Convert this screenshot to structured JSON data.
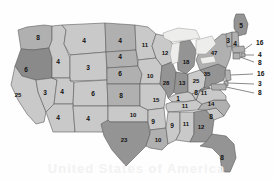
{
  "watermark_text": "United States of America",
  "palette": {
    "light": "#c9c9c9",
    "medium": "#b0b0b0",
    "dark": "#949494",
    "darker": "#8a8a8a",
    "lake": "#ededec",
    "border": "#5d5d5d",
    "label": "#111111",
    "background": "#ffffff"
  },
  "chart_data": {
    "type": "map",
    "ylabel": "",
    "xlabel": "",
    "value_range": [
      1,
      47
    ],
    "legend": "none",
    "categories": [
      "WA",
      "OR",
      "CA",
      "NV",
      "ID",
      "MT",
      "WY",
      "UT",
      "CO",
      "AZ",
      "NM",
      "ND",
      "SD",
      "NE",
      "KS",
      "OK",
      "TX",
      "MN",
      "IA",
      "MO",
      "AR",
      "LA",
      "WI",
      "IL",
      "MI",
      "IN",
      "OH",
      "KY",
      "TN",
      "MS",
      "AL",
      "GA",
      "FL",
      "SC",
      "NC",
      "VA",
      "WV",
      "PA",
      "NY",
      "ME",
      "VT",
      "NH",
      "MA",
      "RI",
      "CT",
      "NJ",
      "DE",
      "MD"
    ],
    "values": [
      8,
      6,
      25,
      3,
      4,
      4,
      3,
      4,
      6,
      4,
      4,
      4,
      4,
      6,
      8,
      10,
      23,
      11,
      10,
      15,
      9,
      10,
      12,
      28,
      18,
      13,
      25,
      1,
      11,
      9,
      11,
      12,
      8,
      8,
      14,
      11,
      8,
      35,
      47,
      5,
      3,
      4,
      16,
      4,
      8,
      16,
      3,
      8
    ],
    "series": [
      {
        "name": "value",
        "points": [
          {
            "state": "WA",
            "label": "Washington",
            "value": 8,
            "shade": "medium"
          },
          {
            "state": "OR",
            "label": "Oregon",
            "value": 6,
            "shade": "darker"
          },
          {
            "state": "CA",
            "label": "California",
            "value": 25,
            "shade": "light"
          },
          {
            "state": "NV",
            "label": "Nevada",
            "value": 3,
            "shade": "light"
          },
          {
            "state": "ID",
            "label": "Idaho",
            "value": 4,
            "shade": "light"
          },
          {
            "state": "MT",
            "label": "Montana",
            "value": 4,
            "shade": "light"
          },
          {
            "state": "WY",
            "label": "Wyoming",
            "value": 3,
            "shade": "light"
          },
          {
            "state": "UT",
            "label": "Utah",
            "value": 4,
            "shade": "light"
          },
          {
            "state": "CO",
            "label": "Colorado",
            "value": 6,
            "shade": "light"
          },
          {
            "state": "AZ",
            "label": "Arizona",
            "value": 4,
            "shade": "light"
          },
          {
            "state": "NM",
            "label": "New Mexico",
            "value": 4,
            "shade": "light"
          },
          {
            "state": "ND",
            "label": "North Dakota",
            "value": 4,
            "shade": "medium"
          },
          {
            "state": "SD",
            "label": "South Dakota",
            "value": 4,
            "shade": "medium"
          },
          {
            "state": "NE",
            "label": "Nebraska",
            "value": 6,
            "shade": "medium"
          },
          {
            "state": "KS",
            "label": "Kansas",
            "value": 8,
            "shade": "medium"
          },
          {
            "state": "OK",
            "label": "Oklahoma",
            "value": 10,
            "shade": "light"
          },
          {
            "state": "TX",
            "label": "Texas",
            "value": 23,
            "shade": "dark"
          },
          {
            "state": "MN",
            "label": "Minnesota",
            "value": 11,
            "shade": "light"
          },
          {
            "state": "IA",
            "label": "Iowa",
            "value": 10,
            "shade": "light"
          },
          {
            "state": "MO",
            "label": "Missouri",
            "value": 15,
            "shade": "light"
          },
          {
            "state": "AR",
            "label": "Arkansas",
            "value": 9,
            "shade": "light"
          },
          {
            "state": "LA",
            "label": "Louisiana",
            "value": 10,
            "shade": "medium"
          },
          {
            "state": "WI",
            "label": "Wisconsin",
            "value": 12,
            "shade": "light"
          },
          {
            "state": "IL",
            "label": "Illinois",
            "value": 28,
            "shade": "dark"
          },
          {
            "state": "MI",
            "label": "Michigan",
            "value": 18,
            "shade": "dark"
          },
          {
            "state": "IN",
            "label": "Indiana",
            "value": 13,
            "shade": "dark"
          },
          {
            "state": "OH",
            "label": "Ohio",
            "value": 25,
            "shade": "light"
          },
          {
            "state": "KY",
            "label": "Kentucky",
            "value": 1,
            "shade": "light"
          },
          {
            "state": "TN",
            "label": "Tennessee",
            "value": 11,
            "shade": "light"
          },
          {
            "state": "MS",
            "label": "Mississippi",
            "value": 9,
            "shade": "light"
          },
          {
            "state": "AL",
            "label": "Alabama",
            "value": 11,
            "shade": "light"
          },
          {
            "state": "GA",
            "label": "Georgia",
            "value": 12,
            "shade": "dark"
          },
          {
            "state": "FL",
            "label": "Florida",
            "value": 8,
            "shade": "dark"
          },
          {
            "state": "SC",
            "label": "South Carolina",
            "value": 8,
            "shade": "light"
          },
          {
            "state": "NC",
            "label": "North Carolina",
            "value": 14,
            "shade": "medium"
          },
          {
            "state": "VA",
            "label": "Virginia",
            "value": 11,
            "shade": "light"
          },
          {
            "state": "WV",
            "label": "West Virginia",
            "value": 8,
            "shade": "light"
          },
          {
            "state": "PA",
            "label": "Pennsylvania",
            "value": 35,
            "shade": "dark"
          },
          {
            "state": "NY",
            "label": "New York",
            "value": 47,
            "shade": "medium"
          },
          {
            "state": "ME",
            "label": "Maine",
            "value": 5,
            "shade": "dark"
          },
          {
            "state": "VT",
            "label": "Vermont",
            "value": 3,
            "shade": "medium"
          },
          {
            "state": "NH",
            "label": "New Hampshire",
            "value": 4,
            "shade": "medium"
          },
          {
            "state": "MA",
            "label": "Massachusetts",
            "value": 16,
            "shade": "medium"
          },
          {
            "state": "RI",
            "label": "Rhode Island",
            "value": 4,
            "shade": "medium"
          },
          {
            "state": "CT",
            "label": "Connecticut",
            "value": 8,
            "shade": "medium"
          },
          {
            "state": "NJ",
            "label": "New Jersey",
            "value": 16,
            "shade": "medium"
          },
          {
            "state": "DE",
            "label": "Delaware",
            "value": 3,
            "shade": "medium"
          },
          {
            "state": "MD",
            "label": "Maryland",
            "value": 8,
            "shade": "medium"
          }
        ]
      }
    ],
    "inline_labels": [
      {
        "id": "wa",
        "text": "8",
        "x": 38,
        "y": 38
      },
      {
        "id": "or",
        "text": "6",
        "x": 26,
        "y": 70
      },
      {
        "id": "ca",
        "text": "25",
        "x": 18,
        "y": 95
      },
      {
        "id": "nv",
        "text": "3",
        "x": 45,
        "y": 93
      },
      {
        "id": "id",
        "text": "4",
        "x": 58,
        "y": 62
      },
      {
        "id": "mt",
        "text": "4",
        "x": 84,
        "y": 41
      },
      {
        "id": "wy",
        "text": "3",
        "x": 88,
        "y": 68
      },
      {
        "id": "ut",
        "text": "4",
        "x": 62,
        "y": 92
      },
      {
        "id": "co",
        "text": "6",
        "x": 93,
        "y": 94
      },
      {
        "id": "az",
        "text": "4",
        "x": 58,
        "y": 118
      },
      {
        "id": "nm",
        "text": "4",
        "x": 88,
        "y": 119
      },
      {
        "id": "nd",
        "text": "4",
        "x": 120,
        "y": 41
      },
      {
        "id": "sd",
        "text": "4",
        "x": 120,
        "y": 57
      },
      {
        "id": "ne",
        "text": "6",
        "x": 120,
        "y": 74
      },
      {
        "id": "ks",
        "text": "8",
        "x": 121,
        "y": 96
      },
      {
        "id": "ok",
        "text": "10",
        "x": 133,
        "y": 115
      },
      {
        "id": "tx",
        "text": "23",
        "x": 124,
        "y": 140
      },
      {
        "id": "mn",
        "text": "11",
        "x": 145,
        "y": 45
      },
      {
        "id": "ia",
        "text": "10",
        "x": 150,
        "y": 76
      },
      {
        "id": "mo",
        "text": "15",
        "x": 156,
        "y": 100
      },
      {
        "id": "ar",
        "text": "9",
        "x": 153,
        "y": 122
      },
      {
        "id": "la",
        "text": "10",
        "x": 158,
        "y": 140
      },
      {
        "id": "wi",
        "text": "12",
        "x": 165,
        "y": 53
      },
      {
        "id": "il",
        "text": "28",
        "x": 166,
        "y": 83
      },
      {
        "id": "mi",
        "text": "18",
        "x": 186,
        "y": 62
      },
      {
        "id": "in",
        "text": "13",
        "x": 182,
        "y": 83
      },
      {
        "id": "oh",
        "text": "25",
        "x": 196,
        "y": 81
      },
      {
        "id": "ky",
        "text": "1",
        "x": 178,
        "y": 99
      },
      {
        "id": "tn",
        "text": "11",
        "x": 185,
        "y": 106
      },
      {
        "id": "ms",
        "text": "9",
        "x": 172,
        "y": 126
      },
      {
        "id": "al",
        "text": "11",
        "x": 186,
        "y": 124
      },
      {
        "id": "ga",
        "text": "12",
        "x": 201,
        "y": 127
      },
      {
        "id": "fl",
        "text": "8",
        "x": 222,
        "y": 158
      },
      {
        "id": "sc",
        "text": "8",
        "x": 211,
        "y": 117
      },
      {
        "id": "nc",
        "text": "14",
        "x": 211,
        "y": 104
      },
      {
        "id": "va",
        "text": "11",
        "x": 204,
        "y": 93
      },
      {
        "id": "wv",
        "text": "8",
        "x": 196,
        "y": 93
      },
      {
        "id": "pa",
        "text": "35",
        "x": 207,
        "y": 74
      },
      {
        "id": "ny",
        "text": "47",
        "x": 214,
        "y": 53
      },
      {
        "id": "me",
        "text": "5",
        "x": 241,
        "y": 26
      },
      {
        "id": "vt",
        "text": "3",
        "x": 228,
        "y": 41
      },
      {
        "id": "nh",
        "text": "4",
        "x": 235,
        "y": 44
      }
    ],
    "callout_labels": [
      {
        "id": "ma",
        "text": "16",
        "x": 256,
        "y": 43
      },
      {
        "id": "ri",
        "text": "4",
        "x": 258,
        "y": 55
      },
      {
        "id": "ct",
        "text": "8",
        "x": 258,
        "y": 63
      },
      {
        "id": "nj",
        "text": "16",
        "x": 257,
        "y": 74
      },
      {
        "id": "de",
        "text": "3",
        "x": 258,
        "y": 84
      },
      {
        "id": "md",
        "text": "8",
        "x": 258,
        "y": 93
      }
    ]
  }
}
